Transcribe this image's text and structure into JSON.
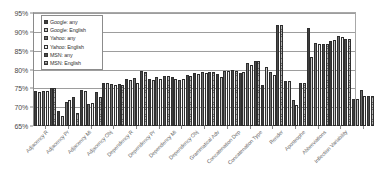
{
  "chart_data": {
    "type": "bar",
    "title": "",
    "subtitle": "",
    "xlabel": "",
    "ylabel": "",
    "ylim": [
      65,
      95
    ],
    "ytick_labels": [
      "95%",
      "90%",
      "85%",
      "80%",
      "75%",
      "70%",
      "65%"
    ],
    "ytick_values": [
      95,
      90,
      85,
      80,
      75,
      70,
      65
    ],
    "grid": true,
    "grid_axis": "y",
    "legend_position": "inside-top-left",
    "value_unit": "%",
    "categories": [
      "Adjacency R",
      "Adjacency Pr",
      "Adjacency Mi",
      "Adjacency Obj",
      "Dependency R",
      "Dependency Pr",
      "Dependency Mi",
      "Dependency Obj",
      "Grammatical Adv",
      "Concatenation Dep",
      "Concatenation Type",
      "Render",
      "Apostrophe",
      "Abbreviations",
      "Inflection Variability"
    ],
    "series": [
      {
        "name": "Google: any",
        "color": "#3d3d3d",
        "values": [
          74.2,
          69.0,
          74.6,
          76.5,
          77.5,
          77.6,
          78.1,
          79.0,
          78.9,
          79.2,
          75.8,
          77.0,
          90.9,
          87.5,
          72.3
        ]
      },
      {
        "name": "Google: English",
        "color": "#c9c9c9",
        "values": [
          74.0,
          67.6,
          74.4,
          76.4,
          77.1,
          77.3,
          77.5,
          78.8,
          77.9,
          79.3,
          80.7,
          76.9,
          83.2,
          87.9,
          72.1
        ]
      },
      {
        "name": "Yahoo: any",
        "color": "#6e6e6e",
        "values": [
          74.3,
          71.4,
          70.9,
          76.1,
          77.8,
          78.0,
          77.3,
          79.4,
          79.6,
          81.7,
          79.4,
          72.0,
          87.0,
          88.9,
          74.5
        ]
      },
      {
        "name": "Yahoo: English",
        "color": "#f2f2f2",
        "values": [
          74.2,
          72.0,
          71.2,
          75.9,
          76.3,
          77.6,
          77.6,
          79.2,
          79.7,
          81.2,
          78.6,
          70.6,
          86.8,
          88.5,
          73.0
        ]
      },
      {
        "name": "MSN: any",
        "color": "#4a4a4a",
        "values": [
          75.1,
          72.8,
          74.1,
          76.2,
          79.5,
          78.4,
          78.6,
          79.4,
          79.8,
          82.2,
          91.9,
          76.4,
          86.9,
          88.2,
          73.0
        ]
      },
      {
        "name": "MSN: English",
        "color": "#b4b4b4",
        "values": [
          75.0,
          68.5,
          72.8,
          76.0,
          79.4,
          78.2,
          78.4,
          79.3,
          79.7,
          82.3,
          91.8,
          76.3,
          86.8,
          88.1,
          72.9
        ]
      }
    ]
  },
  "legend": {
    "items": [
      {
        "label": "Google: any"
      },
      {
        "label": "Google: English"
      },
      {
        "label": "Yahoo: any"
      },
      {
        "label": "Yahoo: English"
      },
      {
        "label": "MSN: any"
      },
      {
        "label": "MSN: English"
      }
    ]
  }
}
